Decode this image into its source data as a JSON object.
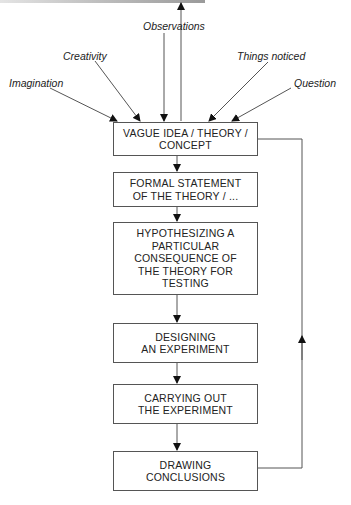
{
  "diagram": {
    "inputs": [
      {
        "id": "imagination",
        "label": "Imagination"
      },
      {
        "id": "creativity",
        "label": "Creativity"
      },
      {
        "id": "observations",
        "label": "Observations"
      },
      {
        "id": "things-noticed",
        "label": "Things noticed"
      },
      {
        "id": "question",
        "label": "Question"
      }
    ],
    "steps": [
      {
        "id": "vague-idea",
        "label": "VAGUE IDEA / THEORY /\nCONCEPT"
      },
      {
        "id": "formal-statement",
        "label": "FORMAL STATEMENT\nOF THE THEORY / ..."
      },
      {
        "id": "hypothesizing",
        "label": "HYPOTHESIZING A\nPARTICULAR\nCONSEQUENCE OF\nTHE THEORY FOR\nTESTING"
      },
      {
        "id": "designing",
        "label": "DESIGNING\nAN EXPERIMENT"
      },
      {
        "id": "carrying-out",
        "label": "CARRYING OUT\nTHE EXPERIMENT"
      },
      {
        "id": "drawing-conclusions",
        "label": "DRAWING\nCONCLUSIONS"
      }
    ],
    "feedback_loop": {
      "from": "drawing-conclusions",
      "to": "vague-idea",
      "direction": "up"
    },
    "colors": {
      "line": "#555555",
      "text": "#222222",
      "background": "#ffffff"
    }
  }
}
